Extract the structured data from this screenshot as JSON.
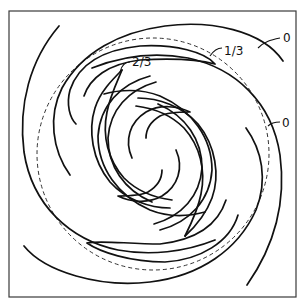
{
  "figure": {
    "frame": {
      "x": 9,
      "y": 11,
      "width": 287,
      "height": 286
    },
    "reference_circle": {
      "cx": 153,
      "cy": 154,
      "r": 116,
      "style": "dashed"
    },
    "contour_labels": [
      {
        "id": "outer-top",
        "text": "0",
        "x": 283,
        "y": 42
      },
      {
        "id": "one-third",
        "text": "1/3",
        "x": 224,
        "y": 55
      },
      {
        "id": "two-thirds",
        "text": "2/3",
        "x": 132,
        "y": 72
      },
      {
        "id": "outer-right",
        "text": "0",
        "x": 282,
        "y": 128
      }
    ],
    "contour_levels": [
      "0",
      "1/3",
      "2/3"
    ],
    "colors": {
      "line": "#111111",
      "frame": "#3a3a3a",
      "background": "#ffffff"
    }
  }
}
